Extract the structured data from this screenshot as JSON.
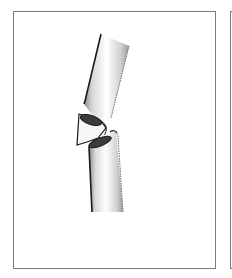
{
  "figure": {
    "subject": "bone fracture illustration",
    "fracture_type": "butterfly fragment",
    "panels": [
      {
        "id": "main",
        "label": "fractured long bone with butterfly fragment"
      },
      {
        "id": "next",
        "label": "adjacent panel (cropped)"
      }
    ],
    "colors": {
      "frame": "#7a7a7a",
      "outline": "#1a1a1a",
      "bone_fill": "#f4f4f4",
      "shading": "#9a9a9a",
      "medullary": "#3c3c3c"
    }
  }
}
